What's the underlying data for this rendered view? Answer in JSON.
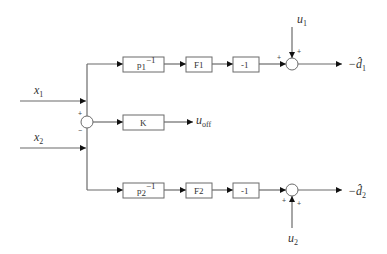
{
  "diagram": {
    "inputs": [
      {
        "id": "x1",
        "label": "x",
        "sub": "1"
      },
      {
        "id": "x2",
        "label": "x",
        "sub": "2"
      }
    ],
    "summing_junction_main": {
      "signs": [
        "+",
        "−"
      ]
    },
    "blocks": {
      "top": [
        {
          "id": "p1inv",
          "label": "p",
          "sub": "1",
          "sup": "−1"
        },
        {
          "id": "f1",
          "label": "F",
          "sub": "1"
        },
        {
          "id": "neg1_top",
          "label": "-1"
        }
      ],
      "middle": [
        {
          "id": "k",
          "label": "K"
        }
      ],
      "bottom": [
        {
          "id": "p2inv",
          "label": "p",
          "sub": "2",
          "sup": "−1"
        },
        {
          "id": "f2",
          "label": "F",
          "sub": "2"
        },
        {
          "id": "neg1_bottom",
          "label": "-1"
        }
      ]
    },
    "summing_junction_top": {
      "signs": [
        "+",
        "+"
      ],
      "disturbance": {
        "label": "u",
        "sub": "1"
      }
    },
    "summing_junction_bottom": {
      "signs": [
        "+",
        "+"
      ],
      "disturbance": {
        "label": "u",
        "sub": "2"
      }
    },
    "outputs": {
      "top": {
        "prefix": "−",
        "label": "d̂",
        "sub": "1"
      },
      "middle": {
        "label": "u",
        "sub": "off"
      },
      "bottom": {
        "prefix": "−",
        "label": "d̂",
        "sub": "2"
      }
    }
  }
}
